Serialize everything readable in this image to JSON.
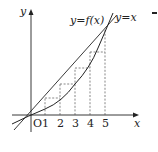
{
  "figure": {
    "axis_x_label": "x",
    "axis_y_label": "y",
    "origin_label": "O",
    "x_ticks": [
      "1",
      "2",
      "3",
      "4",
      "5"
    ],
    "curve_label": "y=f(x)",
    "line_label": "y=x",
    "colors": {
      "stroke": "#222222",
      "dashed": "#555555"
    }
  }
}
